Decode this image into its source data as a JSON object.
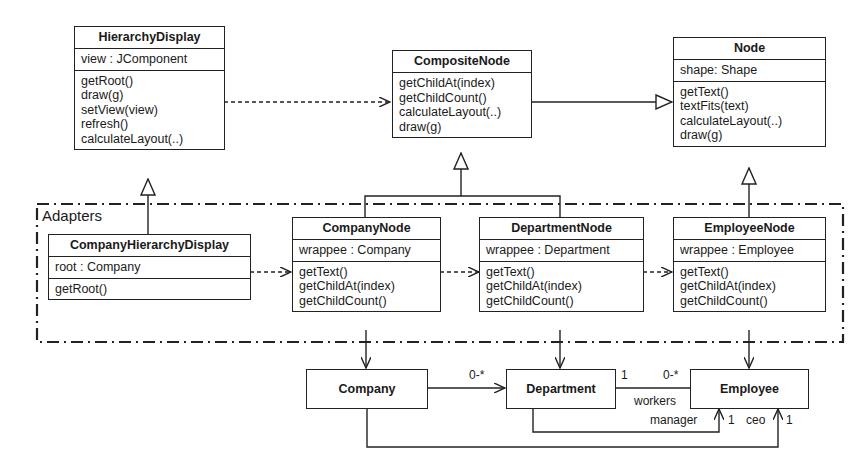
{
  "package": {
    "label": "Adapters"
  },
  "classes": {
    "hierarchy_display": {
      "name": "HierarchyDisplay",
      "attributes": [
        "view : JComponent"
      ],
      "methods": [
        "getRoot()",
        "draw(g)",
        "setView(view)",
        "refresh()",
        "calculateLayout(..)"
      ]
    },
    "composite_node": {
      "name": "CompositeNode",
      "methods": [
        "getChildAt(index)",
        "getChildCount()",
        "calculateLayout(..)",
        "draw(g)"
      ]
    },
    "node": {
      "name": "Node",
      "attributes": [
        "shape: Shape"
      ],
      "methods": [
        "getText()",
        "textFits(text)",
        "calculateLayout(..)",
        "draw(g)"
      ]
    },
    "company_hierarchy_display": {
      "name": "CompanyHierarchyDisplay",
      "attributes": [
        "root : Company"
      ],
      "methods": [
        "getRoot()"
      ]
    },
    "company_node": {
      "name": "CompanyNode",
      "attributes": [
        "wrappee : Company"
      ],
      "methods": [
        "getText()",
        "getChildAt(index)",
        "getChildCount()"
      ]
    },
    "department_node": {
      "name": "DepartmentNode",
      "attributes": [
        "wrappee : Department"
      ],
      "methods": [
        "getText()",
        "getChildAt(index)",
        "getChildCount()"
      ]
    },
    "employee_node": {
      "name": "EmployeeNode",
      "attributes": [
        "wrappee : Employee"
      ],
      "methods": [
        "getText()",
        "getChildAt(index)",
        "getChildCount()"
      ]
    },
    "company": {
      "name": "Company"
    },
    "department": {
      "name": "Department"
    },
    "employee": {
      "name": "Employee"
    }
  },
  "associations": {
    "company_department_mult": "0-*",
    "department_end_mult": "1",
    "employee_end_mult": "0-*",
    "workers_role": "workers",
    "manager_role": "manager",
    "manager_mult": "1",
    "ceo_role": "ceo",
    "ceo_mult": "1"
  }
}
